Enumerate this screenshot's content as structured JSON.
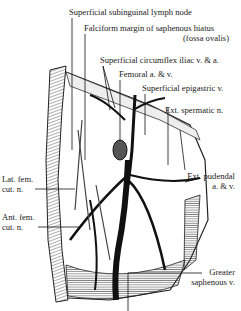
{
  "figure": {
    "labels": {
      "lymph_node": "Superficial subinguinal lymph node",
      "falciform_1": "Falciform margin of saphenous hiatus",
      "falciform_2": "(fossa ovalis)",
      "circumflex": "Superficial circumflex iliac v. & a.",
      "femoral": "Femoral a. & v.",
      "epigastric": "Superficial epigastric v.",
      "spermatic": "Ext. spermatic n.",
      "lat_fem_1": "Lat. fem.",
      "lat_fem_2": "cut. n.",
      "pudendal_1": "Ext. pudendal",
      "pudendal_2": "a. & v.",
      "ant_fem_1": "Ant. fem.",
      "ant_fem_2": "cut. n.",
      "greater_saph_1": "Greater",
      "greater_saph_2": "saphenous v."
    }
  }
}
